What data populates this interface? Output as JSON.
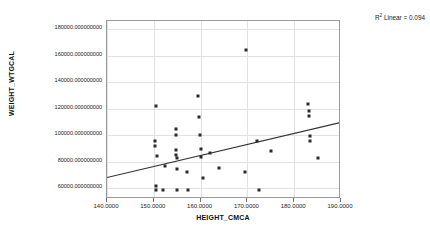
{
  "chart_data": {
    "type": "scatter",
    "title": "",
    "xlabel": "HEIGHT_CMCA",
    "ylabel": "WEIGHT_WTGCAL",
    "xlim": [
      140.0,
      190.0
    ],
    "ylim": [
      52000,
      186000
    ],
    "grid": true,
    "x_ticks": [
      140.0,
      150.0,
      160.0,
      170.0,
      180.0,
      190.0
    ],
    "x_tick_labels": [
      "140.0000",
      "150.0000",
      "160.0000",
      "170.0000",
      "180.0000",
      "190.0000"
    ],
    "y_ticks": [
      60000,
      80000,
      100000,
      120000,
      140000,
      160000,
      180000
    ],
    "y_tick_labels": [
      "60000.000000000",
      "80000.000000000",
      "100000.000000000",
      "120000.000000000",
      "140000.000000000",
      "160000.000000000",
      "180000.000000000"
    ],
    "annotation": "R Linear = 0.094",
    "annotation_prefix": "R",
    "annotation_superscript": "2",
    "annotation_suffix": " Linear = 0.094",
    "r_squared": 0.094,
    "marker_color": "#2b2b2b",
    "fit_line_color": "#333333",
    "grid_color": "#e2e2e2",
    "fit_line": {
      "type": "linear",
      "x_start": 140.0,
      "y_start": 66800,
      "x_end": 190.0,
      "y_end": 108500
    },
    "points": [
      {
        "x": 150.5,
        "y": 122000
      },
      {
        "x": 150.3,
        "y": 95500
      },
      {
        "x": 150.3,
        "y": 92000
      },
      {
        "x": 150.6,
        "y": 84500
      },
      {
        "x": 150.4,
        "y": 62000
      },
      {
        "x": 150.4,
        "y": 58500
      },
      {
        "x": 152.0,
        "y": 58800
      },
      {
        "x": 152.3,
        "y": 76500
      },
      {
        "x": 154.7,
        "y": 104500
      },
      {
        "x": 154.7,
        "y": 100200
      },
      {
        "x": 154.8,
        "y": 89000
      },
      {
        "x": 154.8,
        "y": 85000
      },
      {
        "x": 154.9,
        "y": 83000
      },
      {
        "x": 154.9,
        "y": 74800
      },
      {
        "x": 155.0,
        "y": 58600
      },
      {
        "x": 157.0,
        "y": 72000
      },
      {
        "x": 157.3,
        "y": 58600
      },
      {
        "x": 159.5,
        "y": 129500
      },
      {
        "x": 159.7,
        "y": 113500
      },
      {
        "x": 159.8,
        "y": 100000
      },
      {
        "x": 160.0,
        "y": 90000
      },
      {
        "x": 160.1,
        "y": 83500
      },
      {
        "x": 160.5,
        "y": 68000
      },
      {
        "x": 162.0,
        "y": 86500
      },
      {
        "x": 164.0,
        "y": 75500
      },
      {
        "x": 169.8,
        "y": 164000
      },
      {
        "x": 169.5,
        "y": 72500
      },
      {
        "x": 172.0,
        "y": 96000
      },
      {
        "x": 172.4,
        "y": 59000
      },
      {
        "x": 175.0,
        "y": 88500
      },
      {
        "x": 183.0,
        "y": 123500
      },
      {
        "x": 183.1,
        "y": 118500
      },
      {
        "x": 183.2,
        "y": 114500
      },
      {
        "x": 183.3,
        "y": 99500
      },
      {
        "x": 183.4,
        "y": 95500
      },
      {
        "x": 185.0,
        "y": 82500
      }
    ]
  }
}
